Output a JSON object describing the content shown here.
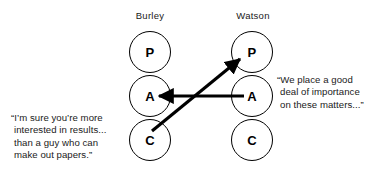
{
  "diagram": {
    "type": "transactional-analysis-pac-diagram",
    "background_color": "#ffffff",
    "ink_color": "#000000",
    "columns": [
      {
        "id": "burley",
        "label": "Burley",
        "ego_states": [
          {
            "id": "burley-p",
            "letter": "P",
            "name": "Parent"
          },
          {
            "id": "burley-a",
            "letter": "A",
            "name": "Adult"
          },
          {
            "id": "burley-c",
            "letter": "C",
            "name": "Child"
          }
        ]
      },
      {
        "id": "watson",
        "label": "Watson",
        "ego_states": [
          {
            "id": "watson-p",
            "letter": "P",
            "name": "Parent"
          },
          {
            "id": "watson-a",
            "letter": "A",
            "name": "Adult"
          },
          {
            "id": "watson-c",
            "letter": "C",
            "name": "Child"
          }
        ]
      }
    ],
    "arrows": [
      {
        "id": "arrow-watson-a-to-burley-a",
        "from": "watson-a",
        "to": "burley-a",
        "style": "straight-horizontal"
      },
      {
        "id": "arrow-burley-c-to-watson-p",
        "from": "burley-c",
        "to": "watson-p",
        "style": "straight-diagonal"
      }
    ],
    "quotes": [
      {
        "id": "quote-burley",
        "speaker": "Burley",
        "text": "“I’m sure you’re more\ninterested in results...\nthan a guy who can\nmake out papers.”"
      },
      {
        "id": "quote-watson",
        "speaker": "Watson",
        "text": "“We place a good\ndeal of importance\non these matters...”"
      }
    ]
  }
}
